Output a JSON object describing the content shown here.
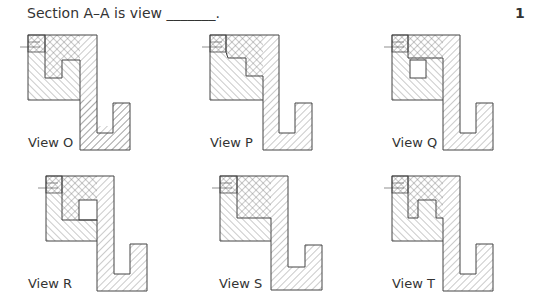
{
  "question": {
    "text": "Section A–A is view _______.",
    "number": "1"
  },
  "views": [
    {
      "id": "O",
      "label": "View O",
      "x": 28,
      "y": 35,
      "inner": "o"
    },
    {
      "id": "P",
      "label": "View P",
      "x": 210,
      "y": 35,
      "inner": "p"
    },
    {
      "id": "Q",
      "label": "View Q",
      "x": 392,
      "y": 35,
      "inner": "q"
    },
    {
      "id": "R",
      "label": "View R",
      "x": 46,
      "y": 176,
      "inner": "r"
    },
    {
      "id": "S",
      "label": "View S",
      "x": 220,
      "y": 176,
      "inner": "s"
    },
    {
      "id": "T",
      "label": "View T",
      "x": 392,
      "y": 176,
      "inner": "t"
    }
  ],
  "colors": {
    "line": "#444444",
    "hatch": "#777777",
    "background": "#ffffff"
  }
}
